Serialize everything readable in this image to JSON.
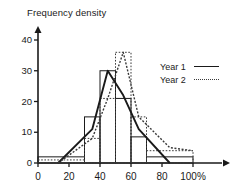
{
  "chart_data": {
    "type": "bar",
    "title": "Frequency density",
    "xlabel": "",
    "ylabel": "Frequency density",
    "xlim": [
      0,
      110
    ],
    "ylim": [
      0,
      43
    ],
    "grid": false,
    "legend_position": "right",
    "x_ticks": [
      "0",
      "20",
      "40",
      "60",
      "80",
      "100%"
    ],
    "x_tick_values": [
      0,
      20,
      40,
      60,
      80,
      100
    ],
    "y_ticks": [
      "0",
      "10",
      "20",
      "30",
      "40"
    ],
    "y_tick_values": [
      0,
      10,
      20,
      30,
      40
    ],
    "bins": [
      {
        "start": 0,
        "end": 30
      },
      {
        "start": 30,
        "end": 40
      },
      {
        "start": 40,
        "end": 50
      },
      {
        "start": 50,
        "end": 60
      },
      {
        "start": 60,
        "end": 70
      },
      {
        "start": 70,
        "end": 100
      }
    ],
    "series": [
      {
        "name": "Year 1",
        "style": "solid",
        "color": "#1a1a1a",
        "values": [
          2,
          15,
          30,
          21,
          8.5,
          2
        ],
        "polygon_x": [
          13,
          35,
          45,
          55,
          65,
          85
        ],
        "polygon_y": [
          0,
          11,
          30,
          22,
          11,
          0
        ]
      },
      {
        "name": "Year 2",
        "style": "dotted",
        "color": "#3a3a3a",
        "values": [
          1,
          8,
          21,
          36,
          15,
          4
        ],
        "polygon_x": [
          13,
          35,
          45,
          55,
          65,
          85,
          100
        ],
        "polygon_y": [
          0,
          8,
          21,
          36,
          15,
          5,
          4
        ]
      }
    ]
  },
  "legend": {
    "items": [
      {
        "label": "Year 1",
        "style": "solid"
      },
      {
        "label": "Year 2",
        "style": "dotted"
      }
    ]
  }
}
